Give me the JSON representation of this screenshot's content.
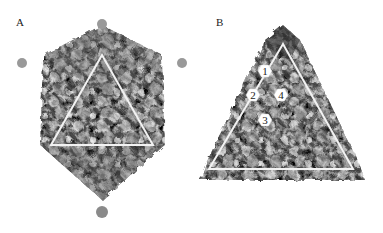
{
  "figure": {
    "panels": [
      {
        "label": "A",
        "description": "Icosahedral capsid surface view with triangular asymmetric face outlined",
        "triangle": {
          "apex": [
            102,
            55
          ],
          "left": [
            51,
            145
          ],
          "right": [
            153,
            145
          ],
          "color": "#f2f2f2"
        }
      },
      {
        "label": "B",
        "description": "Triangular face close-up with numbered hexagonal subunit positions",
        "triangle": {
          "apex": [
            283,
            44
          ],
          "left": [
            209,
            169
          ],
          "right": [
            353,
            169
          ],
          "color": "#f2f2f2"
        },
        "markers": [
          {
            "label": "1",
            "cx": 265,
            "cy": 71
          },
          {
            "label": "2",
            "cx": 253,
            "cy": 95
          },
          {
            "label": "4",
            "cx": 281,
            "cy": 95
          },
          {
            "label": "3",
            "cx": 265,
            "cy": 120
          }
        ]
      }
    ],
    "colors": {
      "background": "#ffffff",
      "surface_dark": "#3a3a3a",
      "surface_mid": "#7a7a7a",
      "surface_light": "#b8b8b8",
      "outline": "#f4f4f4"
    }
  }
}
